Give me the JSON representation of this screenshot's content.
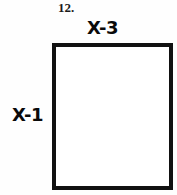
{
  "figure": {
    "problem_number": "12.",
    "shape": "rectangle",
    "stroke_color": "#111111",
    "fill_color": "#ffffff",
    "background_color": "#fefefe"
  },
  "labels": {
    "top": "X-3",
    "left": "X-1"
  }
}
